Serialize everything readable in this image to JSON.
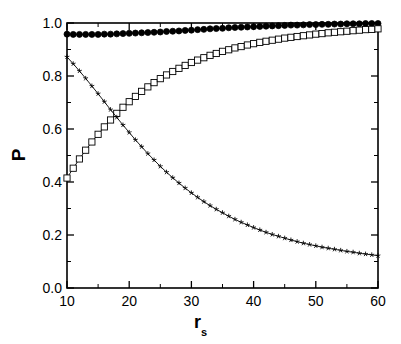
{
  "chart_data": {
    "type": "line",
    "title": "",
    "xlabel": "r_s",
    "ylabel": "P",
    "xlim": [
      10,
      60
    ],
    "ylim": [
      0.0,
      1.0
    ],
    "grid": false,
    "legend": "none",
    "x_tick_labels": [
      "10",
      "20",
      "30",
      "40",
      "50",
      "60"
    ],
    "x_tick_values": [
      10,
      20,
      30,
      40,
      50,
      60
    ],
    "x_minor_ticks": [
      15,
      25,
      35,
      45,
      55
    ],
    "y_tick_labels": [
      "0.0",
      "0.2",
      "0.4",
      "0.6",
      "0.8",
      "1.0"
    ],
    "y_tick_values": [
      0.0,
      0.2,
      0.4,
      0.6,
      0.8,
      1.0
    ],
    "y_minor_ticks": [
      0.1,
      0.3,
      0.5,
      0.7,
      0.9
    ],
    "x": [
      10,
      11,
      12,
      13,
      14,
      15,
      16,
      17,
      18,
      19,
      20,
      21,
      22,
      23,
      24,
      25,
      26,
      27,
      28,
      29,
      30,
      31,
      32,
      33,
      34,
      35,
      36,
      37,
      38,
      39,
      40,
      41,
      42,
      43,
      44,
      45,
      46,
      47,
      48,
      49,
      50,
      51,
      52,
      53,
      54,
      55,
      56,
      57,
      58,
      59,
      60
    ],
    "series": [
      {
        "name": "filled-circles",
        "marker": "filled-circle",
        "color": "#000000",
        "values": [
          0.958,
          0.957,
          0.957,
          0.957,
          0.957,
          0.957,
          0.958,
          0.958,
          0.959,
          0.96,
          0.961,
          0.962,
          0.963,
          0.964,
          0.965,
          0.966,
          0.968,
          0.969,
          0.97,
          0.972,
          0.973,
          0.975,
          0.976,
          0.978,
          0.979,
          0.98,
          0.982,
          0.983,
          0.984,
          0.985,
          0.986,
          0.987,
          0.988,
          0.989,
          0.99,
          0.991,
          0.992,
          0.992,
          0.993,
          0.994,
          0.994,
          0.995,
          0.995,
          0.996,
          0.996,
          0.997,
          0.997,
          0.997,
          0.998,
          0.998,
          0.998
        ]
      },
      {
        "name": "open-squares",
        "marker": "open-square",
        "color": "#000000",
        "values": [
          0.415,
          0.452,
          0.487,
          0.52,
          0.551,
          0.58,
          0.608,
          0.634,
          0.659,
          0.682,
          0.703,
          0.723,
          0.742,
          0.759,
          0.775,
          0.79,
          0.804,
          0.817,
          0.829,
          0.84,
          0.851,
          0.86,
          0.869,
          0.878,
          0.885,
          0.893,
          0.899,
          0.906,
          0.911,
          0.917,
          0.922,
          0.927,
          0.931,
          0.935,
          0.939,
          0.943,
          0.946,
          0.949,
          0.952,
          0.955,
          0.958,
          0.96,
          0.963,
          0.965,
          0.967,
          0.969,
          0.971,
          0.973,
          0.975,
          0.976,
          0.978
        ]
      },
      {
        "name": "star-markers",
        "marker": "star",
        "color": "#000000",
        "values": [
          0.872,
          0.846,
          0.819,
          0.791,
          0.762,
          0.733,
          0.703,
          0.673,
          0.644,
          0.615,
          0.587,
          0.559,
          0.533,
          0.507,
          0.483,
          0.459,
          0.437,
          0.416,
          0.396,
          0.377,
          0.359,
          0.342,
          0.326,
          0.311,
          0.297,
          0.284,
          0.271,
          0.259,
          0.248,
          0.238,
          0.228,
          0.219,
          0.21,
          0.202,
          0.195,
          0.188,
          0.181,
          0.175,
          0.169,
          0.164,
          0.159,
          0.154,
          0.15,
          0.146,
          0.142,
          0.138,
          0.135,
          0.131,
          0.128,
          0.125,
          0.122
        ]
      }
    ]
  },
  "axes": {
    "ylabel_text": "P",
    "xlabel_base": "r",
    "xlabel_sub": "s"
  }
}
